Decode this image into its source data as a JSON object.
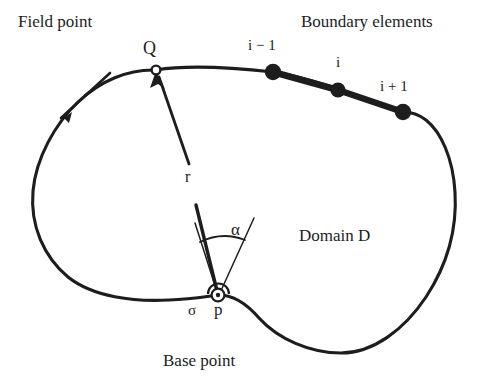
{
  "figure": {
    "background_color": "#ffffff",
    "ink_color": "#1d1d1d",
    "width": 497,
    "height": 387
  },
  "labels": {
    "field_point": "Field point",
    "boundary_elements": "Boundary elements",
    "field_point_marker": "Q",
    "node_prev": "i − 1",
    "node_current": "i",
    "node_next": "i + 1",
    "radius": "r",
    "angle": "α",
    "domain": "Domain D",
    "sigma": "σ",
    "base_point_marker": "p",
    "base_point": "Base point"
  },
  "geometry": {
    "domain_boundary_path": "M 156,70 C 130,69 102,80 80,101 C 58,122 38,157 34,190 C 30,224 43,256 66,276 C 90,297 133,302 168,300 C 192,298 208,296 218,295 C 232,294 244,301 258,317 C 276,337 310,352 340,352 C 372,352 404,330 425,297 C 448,261 456,224 455,192 C 454,160 443,134 427,118 C 411,102 403,112 403,112",
    "boundary_top_right_path": "M 156,70 C 190,66 232,68 273,72 C 305,76 340,88 403,112",
    "boundary_element_segment": "M 273,72 L 338,90 L 403,112",
    "nodes": [
      {
        "name": "node-i-minus-1",
        "x": 273,
        "y": 72,
        "r": 8
      },
      {
        "name": "node-i",
        "x": 338,
        "y": 90,
        "r": 7.5
      },
      {
        "name": "node-i-plus-1",
        "x": 403,
        "y": 112,
        "r": 8
      }
    ],
    "field_point": {
      "x": 156,
      "y": 70,
      "r": 4.5
    },
    "base_point": {
      "x": 218,
      "y": 295,
      "r": 6.5,
      "inner_r": 2.2
    },
    "radius_vector": {
      "from_x": 218,
      "from_y": 295,
      "to_x": 156,
      "to_y": 70,
      "gap_start_y": 205,
      "gap_end_y": 163
    },
    "angle_arc": {
      "cx": 218,
      "cy": 295,
      "radius": 56,
      "start_deg": 193,
      "end_deg": 290
    },
    "tangent_ray": {
      "x1": 218,
      "y1": 295,
      "x2": 253,
      "y2": 219
    },
    "normal_ray": {
      "x1": 218,
      "y1": 295,
      "x2": 196,
      "y2": 224
    },
    "direction_arrow": {
      "x1": 110,
      "y1": 74,
      "x2": 57,
      "y2": 122
    },
    "sigma_tick": {
      "x1": 85,
      "y1": 292,
      "x2": 211,
      "y2": 296
    }
  }
}
